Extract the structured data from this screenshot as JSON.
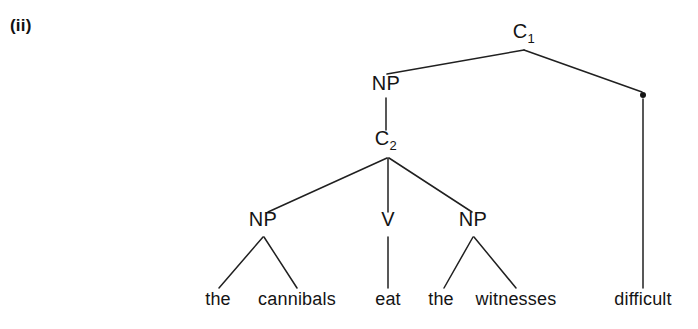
{
  "figure": {
    "example_number": "(ii)",
    "caption": "",
    "type": "syntax-tree"
  },
  "tree": {
    "nodes": [
      {
        "id": "c1",
        "label": "C",
        "subscript": "1",
        "x": 524,
        "y": 38,
        "kind": "category"
      },
      {
        "id": "np_top",
        "label": "NP",
        "subscript": "",
        "x": 386,
        "y": 90,
        "kind": "category"
      },
      {
        "id": "c2",
        "label": "C",
        "subscript": "2",
        "x": 386,
        "y": 145,
        "kind": "category"
      },
      {
        "id": "np_subj",
        "label": "NP",
        "subscript": "",
        "x": 263,
        "y": 226,
        "kind": "category"
      },
      {
        "id": "v",
        "label": "V",
        "subscript": "",
        "x": 388,
        "y": 226,
        "kind": "category"
      },
      {
        "id": "np_obj",
        "label": "NP",
        "subscript": "",
        "x": 473,
        "y": 226,
        "kind": "category"
      }
    ],
    "dot_node": {
      "id": "pred_dot",
      "label": ".",
      "x": 643,
      "y": 95
    },
    "leaves": [
      {
        "id": "leaf_the1",
        "text": "the",
        "x": 218,
        "y": 305
      },
      {
        "id": "leaf_cannibals",
        "text": "cannibals",
        "x": 297,
        "y": 305
      },
      {
        "id": "leaf_eat",
        "text": "eat",
        "x": 388,
        "y": 305
      },
      {
        "id": "leaf_the2",
        "text": "the",
        "x": 441,
        "y": 305
      },
      {
        "id": "leaf_witnesses",
        "text": "witnesses",
        "x": 516,
        "y": 305
      },
      {
        "id": "leaf_difficult",
        "text": "difficult",
        "x": 643,
        "y": 305
      }
    ],
    "edges": [
      {
        "id": "e_c1_np",
        "from": "c1",
        "to": "np_top",
        "x1": 524,
        "y1": 50,
        "x2": 387,
        "y2": 74
      },
      {
        "id": "e_c1_dot",
        "from": "c1",
        "to": "pred_dot",
        "x1": 524,
        "y1": 50,
        "x2": 642,
        "y2": 92
      },
      {
        "id": "e_np_c2",
        "from": "np_top",
        "to": "c2",
        "x1": 386,
        "y1": 98,
        "x2": 386,
        "y2": 130
      },
      {
        "id": "e_c2_npsubj",
        "from": "c2",
        "to": "np_subj",
        "x1": 387,
        "y1": 158,
        "x2": 268,
        "y2": 212
      },
      {
        "id": "e_c2_v",
        "from": "c2",
        "to": "v",
        "x1": 388,
        "y1": 158,
        "x2": 388,
        "y2": 212
      },
      {
        "id": "e_c2_npobj",
        "from": "c2",
        "to": "np_obj",
        "x1": 389,
        "y1": 158,
        "x2": 472,
        "y2": 212
      },
      {
        "id": "e_npsubj_the",
        "from": "np_subj",
        "to": "leaf_the1",
        "x1": 263,
        "y1": 237,
        "x2": 219,
        "y2": 288
      },
      {
        "id": "e_npsubj_cann",
        "from": "np_subj",
        "to": "leaf_cannibals",
        "x1": 264,
        "y1": 237,
        "x2": 297,
        "y2": 288
      },
      {
        "id": "e_v_eat",
        "from": "v",
        "to": "leaf_eat",
        "x1": 388,
        "y1": 237,
        "x2": 388,
        "y2": 288
      },
      {
        "id": "e_npobj_the",
        "from": "np_obj",
        "to": "leaf_the2",
        "x1": 473,
        "y1": 237,
        "x2": 444,
        "y2": 288
      },
      {
        "id": "e_npobj_witn",
        "from": "np_obj",
        "to": "leaf_witnesses",
        "x1": 474,
        "y1": 237,
        "x2": 516,
        "y2": 288
      },
      {
        "id": "e_dot_diff",
        "from": "pred_dot",
        "to": "leaf_difficult",
        "x1": 643,
        "y1": 99,
        "x2": 643,
        "y2": 288
      }
    ]
  },
  "colors": {
    "ink": "#141414",
    "line": "#202020",
    "background": "#ffffff"
  }
}
